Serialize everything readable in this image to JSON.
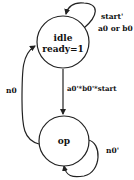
{
  "diagram": {
    "type": "state-machine",
    "states": [
      {
        "id": "idle",
        "name": "idle",
        "output": "ready=1"
      },
      {
        "id": "op",
        "name": "op",
        "output": ""
      }
    ],
    "transitions": [
      {
        "from": "idle",
        "to": "idle",
        "label_line1": "start'",
        "label_line2": "a0 or b0"
      },
      {
        "from": "idle",
        "to": "op",
        "label": "a0'*b0'*start"
      },
      {
        "from": "op",
        "to": "idle",
        "label": "n0"
      },
      {
        "from": "op",
        "to": "op",
        "label": "n0'"
      }
    ]
  }
}
